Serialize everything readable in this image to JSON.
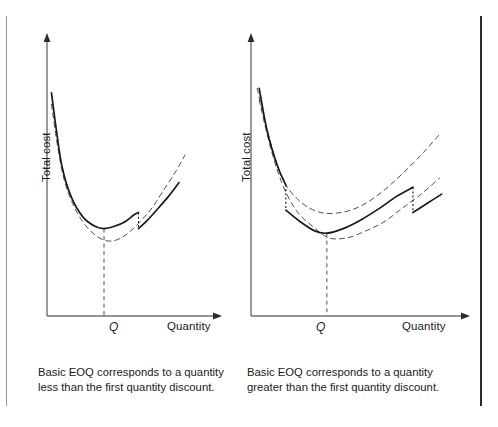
{
  "figure": {
    "background_color": "#ffffff",
    "line_color": "#1a1a1a",
    "rule_left_color": "#9a9a9a",
    "rule_right_color": "#2b2b2b"
  },
  "panels": [
    {
      "id": "left",
      "y_axis_label": "Total cost",
      "x_axis_label": "Quantity",
      "q_label": "Q",
      "caption": "Basic EOQ corresponds to a quantity\nless than the first quantity discount."
    },
    {
      "id": "right",
      "y_axis_label": "Total cost",
      "x_axis_label": "Quantity",
      "q_label": "Q",
      "caption": "Basic EOQ corresponds to a quantity\ngreater than the first quantity discount."
    }
  ],
  "chart_data": [
    {
      "type": "line",
      "title": "",
      "xlabel": "Quantity",
      "ylabel": "Total cost",
      "grid": false,
      "legend": "none",
      "axis_arrows": true,
      "xlim": [
        0,
        100
      ],
      "ylim": [
        0,
        100
      ],
      "annotations": [
        {
          "text": "Q",
          "x": 38,
          "y": 0,
          "style": "italic",
          "note": "EOQ quantity tick on x-axis"
        }
      ],
      "dropline": {
        "from_x": 38,
        "from_y": 38,
        "to_y": 0,
        "style": "dashed"
      },
      "price_break": {
        "x": 61,
        "drop_from_y": 45,
        "drop_to_y": 38,
        "style": "dotted"
      },
      "series": [
        {
          "name": "base-cost-curve",
          "style": "solid",
          "role": "effective total cost curve (basic EOQ below first discount)",
          "x": [
            3,
            6,
            10,
            16,
            24,
            32,
            38,
            45,
            52,
            58,
            61,
            61,
            66,
            73,
            81,
            88
          ],
          "y": [
            97,
            82,
            65,
            52,
            43,
            39,
            38,
            39,
            41,
            44,
            45,
            38,
            41,
            46,
            52,
            58
          ]
        },
        {
          "name": "discount-cost-curve",
          "style": "dashed",
          "role": "total cost curve at discounted price",
          "x": [
            3,
            7,
            12,
            20,
            29,
            38,
            46,
            54,
            62,
            70,
            78,
            86,
            92
          ],
          "y": [
            92,
            74,
            58,
            45,
            37,
            33,
            33,
            36,
            41,
            47,
            55,
            63,
            70
          ]
        }
      ]
    },
    {
      "type": "line",
      "title": "",
      "xlabel": "Quantity",
      "ylabel": "Total cost",
      "grid": false,
      "legend": "none",
      "axis_arrows": true,
      "xlim": [
        0,
        100
      ],
      "ylim": [
        0,
        100
      ],
      "annotations": [
        {
          "text": "Q",
          "x": 37,
          "y": 0,
          "style": "italic",
          "note": "EOQ quantity tick on x-axis"
        }
      ],
      "dropline": {
        "from_x": 37,
        "from_y": 36,
        "to_y": 0,
        "style": "dashed"
      },
      "price_breaks": [
        {
          "x": 17,
          "drop_from_y": 57,
          "drop_to_y": 46,
          "style": "dotted"
        },
        {
          "x": 79,
          "drop_from_y": 56,
          "drop_to_y": 45,
          "style": "dotted"
        }
      ],
      "series": [
        {
          "name": "upper-price-curve",
          "style": "dashed",
          "role": "total cost curve at highest price (no discount)",
          "x": [
            3,
            7,
            12,
            17,
            25,
            34,
            44,
            54,
            64,
            74,
            84,
            92
          ],
          "y": [
            99,
            84,
            68,
            57,
            49,
            45,
            45,
            48,
            54,
            62,
            71,
            79
          ]
        },
        {
          "name": "effective-cost-curve",
          "style": "solid",
          "role": "effective total cost curve (basic EOQ above first discount)",
          "x": [
            4,
            8,
            13,
            17,
            17,
            24,
            31,
            37,
            45,
            54,
            63,
            71,
            79,
            79,
            86,
            93
          ],
          "y": [
            99,
            80,
            65,
            57,
            46,
            41,
            37,
            36,
            38,
            42,
            47,
            52,
            56,
            45,
            49,
            53
          ]
        },
        {
          "name": "lower-price-curve",
          "style": "dashed",
          "role": "total cost curve at lowest price (largest discount)",
          "x": [
            4,
            9,
            15,
            22,
            30,
            38,
            47,
            56,
            65,
            74,
            83,
            92
          ],
          "y": [
            94,
            75,
            58,
            46,
            39,
            34,
            34,
            37,
            41,
            47,
            53,
            60
          ]
        }
      ]
    }
  ]
}
